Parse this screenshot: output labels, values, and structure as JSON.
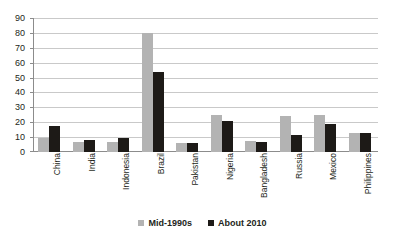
{
  "chart_data": {
    "type": "bar",
    "title": "",
    "subtitle": "",
    "xlabel": "",
    "ylabel": "",
    "ylim": [
      0,
      90
    ],
    "ytick_step": 10,
    "yticks": [
      90,
      80,
      70,
      60,
      50,
      40,
      30,
      20,
      10,
      0
    ],
    "grid": true,
    "legend_position": "bottom",
    "categories": [
      "China",
      "India",
      "Indonesia",
      "Brazil",
      "Pakistan",
      "Nigeria",
      "Bangladesh",
      "Russia",
      "Mexico",
      "Philippines"
    ],
    "series": [
      {
        "name": "Mid-1990s",
        "color": "#b3b3b3",
        "values": [
          9.5,
          7,
          7,
          80,
          6,
          25,
          7.5,
          24,
          25,
          13
        ]
      },
      {
        "name": "About 2010",
        "color": "#1d1a17",
        "values": [
          17.5,
          8,
          9.5,
          54,
          6,
          21,
          7,
          11.5,
          19,
          13
        ]
      }
    ]
  },
  "legend": {
    "items": [
      {
        "label": "Mid-1990s"
      },
      {
        "label": "About 2010"
      }
    ]
  }
}
